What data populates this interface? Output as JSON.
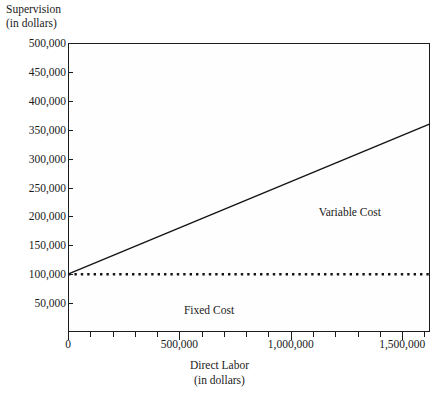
{
  "chart_data": {
    "type": "line",
    "title": "",
    "ylabel": "Supervision (in dollars)",
    "ylabel_line1": "Supervision",
    "ylabel_line2": "(in dollars)",
    "xlabel": "Direct Labor (in dollars)",
    "xlabel_line1": "Direct Labor",
    "xlabel_line2": "(in dollars)",
    "xlim": [
      0,
      1625000
    ],
    "ylim": [
      0,
      500000
    ],
    "grid": false,
    "legend_position": "inline-annotation",
    "y_ticks": [
      50000,
      100000,
      150000,
      200000,
      250000,
      300000,
      350000,
      400000,
      450000,
      500000
    ],
    "y_tick_labels": [
      "50,000",
      "100,000",
      "150,000",
      "200,000",
      "250,000",
      "300,000",
      "350,000",
      "400,000",
      "450,000",
      "500,000"
    ],
    "x_ticks": [
      0,
      500000,
      1000000,
      1500000
    ],
    "x_tick_labels": [
      "0",
      "500,000",
      "1,000,000",
      "1,500,000"
    ],
    "x_minor_ticks": [
      100000,
      200000,
      300000,
      400000,
      600000,
      700000,
      800000,
      900000,
      1100000,
      1200000,
      1300000,
      1400000,
      1600000
    ],
    "series": [
      {
        "name": "Variable Cost",
        "style": "solid",
        "color": "#141414",
        "points": [
          [
            0,
            100000
          ],
          [
            1625000,
            360000
          ]
        ],
        "intercept": 100000,
        "slope_per_dollar": 0.16,
        "annotation_label": "Variable Cost"
      },
      {
        "name": "Fixed Cost",
        "style": "dotted",
        "color": "#141414",
        "points": [
          [
            0,
            100000
          ],
          [
            1625000,
            100000
          ]
        ],
        "value": 100000,
        "annotation_label": "Fixed Cost"
      }
    ],
    "annotations": [
      {
        "text": "Variable Cost",
        "x": 1265000,
        "y": 208000
      },
      {
        "text": "Fixed Cost",
        "x": 633000,
        "y": 38000
      }
    ],
    "colors": {
      "background": "#ffffff",
      "plot_background": "#fefefe",
      "axis": "#1c1c1c",
      "text": "#1a1a1a",
      "line": "#141414"
    }
  }
}
